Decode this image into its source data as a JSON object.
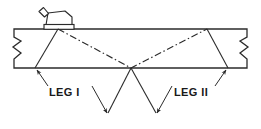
{
  "diagram": {
    "type": "technical-line-drawing",
    "background_color": "#ffffff",
    "line_color": "#2b2b2b",
    "text_color": "#1a1a1a",
    "labels": {
      "leg1": "LEG I",
      "leg2": "LEG II"
    },
    "components": {
      "plate": {
        "name": "test-plate",
        "top_y": 29,
        "bottom_y": 68,
        "left_x": 14,
        "right_x": 247,
        "break_symbol": "zigzag"
      },
      "transducer": {
        "name": "angle-beam-transducer",
        "x": 44,
        "y": 9,
        "width": 28,
        "height": 18,
        "has_connector": true
      },
      "beam_axis": {
        "name": "sound-beam-centerline",
        "linestyle": "dash-dot",
        "entry_point_x": 58,
        "entry_point_y": 29,
        "reflection_point_x": 131,
        "reflection_point_y": 68,
        "exit_point_x": 207,
        "exit_point_y": 29
      },
      "leg1_path": {
        "name": "leg-1-boundary",
        "from": [
          58,
          29
        ],
        "to": [
          35,
          68
        ]
      },
      "leg2_path": {
        "name": "leg-2-boundary",
        "from": [
          207,
          29
        ],
        "to": [
          228,
          68
        ]
      }
    },
    "annotations": [
      {
        "id": "leg1-leader-upper",
        "name": "leg-1-upper-leader",
        "arrow_at": [
          36,
          70
        ],
        "text_anchor": [
          46,
          92
        ]
      },
      {
        "id": "leg1-leader-lower",
        "name": "leg-1-lower-leader",
        "arrow_at": [
          107,
          115
        ],
        "text_anchor": [
          93,
          92
        ]
      },
      {
        "id": "leg2-leader-upper",
        "name": "leg-2-upper-leader",
        "arrow_at": [
          226,
          70
        ],
        "text_anchor": [
          212,
          92
        ]
      },
      {
        "id": "leg2-leader-lower",
        "name": "leg-2-lower-leader",
        "arrow_at": [
          157,
          115
        ],
        "text_anchor": [
          171,
          92
        ]
      }
    ]
  }
}
